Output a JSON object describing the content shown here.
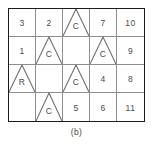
{
  "figure": {
    "caption": "(b)",
    "colors": {
      "border": "#1b1b1b",
      "gridline": "#8e8e8e",
      "triangle": "#6f6f6f",
      "text": "#4a4a4a",
      "background": "#ffffff"
    },
    "grid": {
      "columns": 5,
      "rows": 4,
      "cells": [
        {
          "row": 1,
          "col": 1,
          "label": "3",
          "triangle": false
        },
        {
          "row": 1,
          "col": 2,
          "label": "2",
          "triangle": false
        },
        {
          "row": 1,
          "col": 3,
          "label": "C",
          "triangle": true
        },
        {
          "row": 1,
          "col": 4,
          "label": "7",
          "triangle": false
        },
        {
          "row": 1,
          "col": 5,
          "label": "10",
          "triangle": false
        },
        {
          "row": 2,
          "col": 1,
          "label": "1",
          "triangle": false
        },
        {
          "row": 2,
          "col": 2,
          "label": "C",
          "triangle": true
        },
        {
          "row": 2,
          "col": 3,
          "label": "",
          "triangle": false
        },
        {
          "row": 2,
          "col": 4,
          "label": "C",
          "triangle": true
        },
        {
          "row": 2,
          "col": 5,
          "label": "9",
          "triangle": false
        },
        {
          "row": 3,
          "col": 1,
          "label": "R",
          "triangle": true
        },
        {
          "row": 3,
          "col": 2,
          "label": "",
          "triangle": false
        },
        {
          "row": 3,
          "col": 3,
          "label": "C",
          "triangle": true
        },
        {
          "row": 3,
          "col": 4,
          "label": "4",
          "triangle": false
        },
        {
          "row": 3,
          "col": 5,
          "label": "8",
          "triangle": false
        },
        {
          "row": 4,
          "col": 1,
          "label": "",
          "triangle": false
        },
        {
          "row": 4,
          "col": 2,
          "label": "C",
          "triangle": true
        },
        {
          "row": 4,
          "col": 3,
          "label": "5",
          "triangle": false
        },
        {
          "row": 4,
          "col": 4,
          "label": "6",
          "triangle": false
        },
        {
          "row": 4,
          "col": 5,
          "label": "11",
          "triangle": false
        }
      ]
    }
  }
}
